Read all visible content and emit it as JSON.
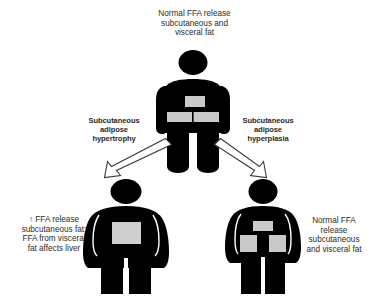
{
  "figure": {
    "background_color": "#ffffff",
    "body_color": "#000000",
    "fat_depot_color": "#cccccc",
    "arrow_fill": "#ffffff",
    "arrow_stroke": "#333333",
    "text_color": "#2b2b2b"
  },
  "top": {
    "label_lines": [
      "Normal FFA release",
      "subcutaneous and",
      "visceral fat"
    ],
    "figure_name": "lean-person-pictogram",
    "depots": [
      "visceral-fat-patch",
      "subcutaneous-hip-band"
    ]
  },
  "branches": {
    "left": {
      "label_lines": [
        "Subcutaneous",
        "adipose",
        "hypertrophy"
      ],
      "arrow_name": "arrow-down-left",
      "arrow_direction": "down-left"
    },
    "right": {
      "label_lines": [
        "Subcutaneous",
        "adipose",
        "hyperplasia"
      ],
      "arrow_name": "arrow-down-right",
      "arrow_direction": "down-right"
    }
  },
  "bottom_left": {
    "label_lines": [
      "↑ FFA release",
      "subcutaneous fat;",
      "FFA from visceral",
      "fat affects liver"
    ],
    "figure_name": "obese-person-pictogram-hypertrophy",
    "depots": [
      "large-visceral-fat-rectangle"
    ]
  },
  "bottom_right": {
    "label_lines": [
      "Normal FFA",
      "release",
      "subcutaneous",
      "and visceral fat"
    ],
    "figure_name": "overweight-person-pictogram-hyperplasia",
    "depots": [
      "small-visceral-fat-patch",
      "left-subcutaneous-hip-rectangle",
      "right-subcutaneous-hip-rectangle"
    ]
  }
}
